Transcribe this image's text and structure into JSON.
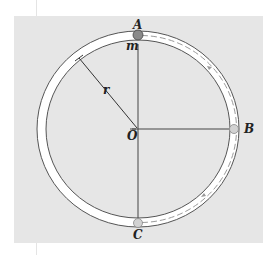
{
  "figure": {
    "type": "diagram",
    "labels": {
      "top_point": "A",
      "right_point": "B",
      "bottom_point": "C",
      "center": "O",
      "mass": "m",
      "radius": "r"
    },
    "colors": {
      "panel_background": "#e6e6e6",
      "tube_fill": "#ffffff",
      "outline": "#555555",
      "particle_A": "#8a8a8a",
      "particle_ghost": "#c8c8c8",
      "dashed_path": "#9a9a9a"
    },
    "geometry": {
      "center_x": 138,
      "center_y": 129,
      "outer_rx": 101,
      "outer_ry": 98,
      "inner_rx": 92,
      "inner_ry": 89
    }
  }
}
